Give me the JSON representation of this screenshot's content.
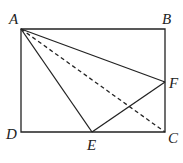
{
  "diagram": {
    "type": "geometry",
    "points": {
      "A": {
        "label": "A",
        "x": 21,
        "y": 29
      },
      "B": {
        "label": "B",
        "x": 165,
        "y": 29
      },
      "C": {
        "label": "C",
        "x": 165,
        "y": 132
      },
      "D": {
        "label": "D",
        "x": 21,
        "y": 132
      },
      "E": {
        "label": "E",
        "x": 92,
        "y": 132
      },
      "F": {
        "label": "F",
        "x": 165,
        "y": 82
      }
    },
    "segments_solid": [
      "AB",
      "BC",
      "CD",
      "DA",
      "AE",
      "AF",
      "EF"
    ],
    "segments_dashed": [
      "AC"
    ],
    "colors": {
      "line": "#222222",
      "background": "#ffffff"
    }
  }
}
